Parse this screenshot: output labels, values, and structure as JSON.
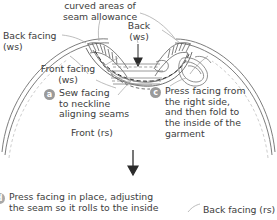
{
  "diagram": {
    "callouts": {
      "curved_areas": "curved areas of\nseam allowance",
      "back_facing_ws": "Back facing\n(ws)",
      "back_ws": "Back\n(ws)",
      "front_facing_ws": "Front facing\n(ws)",
      "front_rs": "Front (rs)",
      "back_facing_rs": "Back facing (rs)"
    },
    "steps": [
      {
        "key": "a",
        "label": "a",
        "text": "Sew facing\nto neckline\naligning seams"
      },
      {
        "key": "c",
        "label": "c",
        "text": "Press facing from\nthe right side,\nand then fold to\nthe inside of the\ngarment"
      },
      {
        "key": "d",
        "label": "d",
        "text": "Press facing in place, adjusting\nthe seam so it rolls to the inside"
      }
    ],
    "flow_arrow": "down-arrow",
    "colors": {
      "ink": "#3d3d3d",
      "line": "#6e6e6e",
      "badge": "#8d8d8d",
      "badge_text": "#ffffff",
      "background": "#ffffff"
    }
  }
}
